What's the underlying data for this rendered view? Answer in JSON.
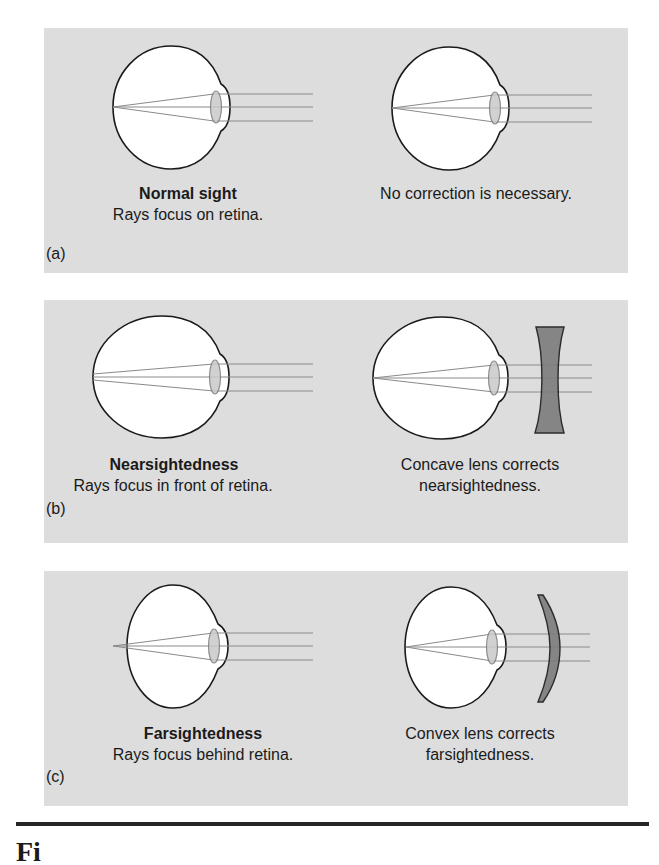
{
  "figure": {
    "colors": {
      "panel_bg": "#dddddd",
      "eye_fill": "#ffffff",
      "eye_outline": "#1a1a1a",
      "ray": "#8a8a8a",
      "crystalline_lens_fill": "#c9c9c9",
      "corrective_lens_fill": "#7c7c7c",
      "rule": "#262626"
    },
    "panels": [
      {
        "label": "(a)",
        "left": {
          "title": "Normal sight",
          "subtitle": "Rays focus on retina."
        },
        "right": {
          "lines": [
            "No correction is necessary."
          ],
          "corrective_lens": "none"
        }
      },
      {
        "label": "(b)",
        "left": {
          "title": "Nearsightedness",
          "subtitle": "Rays focus in front of retina."
        },
        "right": {
          "lines": [
            "Concave lens corrects",
            "nearsightedness."
          ],
          "corrective_lens": "concave"
        }
      },
      {
        "label": "(c)",
        "left": {
          "title": "Farsightedness",
          "subtitle": "Rays focus behind retina."
        },
        "right": {
          "lines": [
            "Convex lens corrects",
            "farsightedness."
          ],
          "corrective_lens": "convex"
        }
      }
    ],
    "caption_partial": "Fi"
  }
}
